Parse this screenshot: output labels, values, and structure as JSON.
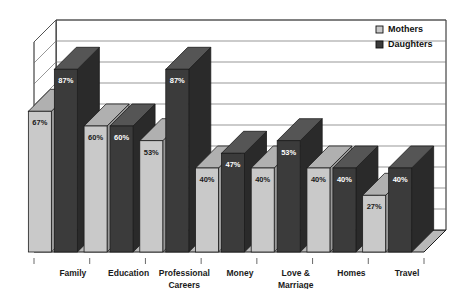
{
  "chart_data": {
    "type": "bar",
    "title": "",
    "subtitle": "",
    "xlabel": "",
    "ylabel": "",
    "ylim": [
      0,
      100
    ],
    "grid": true,
    "legend_position": "top-right",
    "style": "3d-clustered-column",
    "categories": [
      "Family",
      "Education",
      "Professional Careers",
      "Money",
      "Love & Marriage",
      "Homes",
      "Travel"
    ],
    "series": [
      {
        "name": "Mothers",
        "color": "#c9c9c9",
        "values": [
          67,
          60,
          53,
          40,
          40,
          40,
          27
        ],
        "labels": [
          "67%",
          "60%",
          "53%",
          "40%",
          "40%",
          "40%",
          "27%"
        ]
      },
      {
        "name": "Daughters",
        "color": "#3b3b3b",
        "values": [
          87,
          60,
          87,
          47,
          53,
          40,
          40
        ],
        "labels": [
          "87%",
          "60%",
          "87%",
          "47%",
          "53%",
          "40%",
          "40%"
        ]
      }
    ],
    "ticks": [
      0,
      10,
      20,
      30,
      40,
      50,
      60,
      70,
      80,
      90,
      100
    ]
  },
  "legend": {
    "items": [
      {
        "label": "Mothers",
        "swatch": "#c9c9c9",
        "swatch_name": "legend-swatch-mothers"
      },
      {
        "label": "Daughters",
        "swatch": "#3b3b3b",
        "swatch_name": "legend-swatch-daughters"
      }
    ]
  },
  "colors": {
    "mothers_front": "#c9c9c9",
    "mothers_top": "#b0b0b0",
    "mothers_side": "#9a9a9a",
    "daughters_front": "#3b3b3b",
    "daughters_top": "#555555",
    "daughters_side": "#2a2a2a",
    "floor": "#b8b8b8",
    "wall": "#ffffff",
    "outline": "#1c1c1c",
    "gridline": "#6b6b6b",
    "text": "#1a1a1a"
  },
  "category_label_lines": [
    [
      "Family"
    ],
    [
      "Education"
    ],
    [
      "Professional",
      "Careers"
    ],
    [
      "Money"
    ],
    [
      "Love &",
      "Marriage"
    ],
    [
      "Homes"
    ],
    [
      "Travel"
    ]
  ]
}
